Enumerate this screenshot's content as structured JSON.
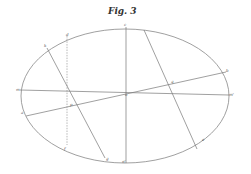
{
  "figure": {
    "title": "Fig. 3",
    "ellipse": {
      "cx": 125,
      "cy": 96,
      "rx": 104,
      "ry": 67
    },
    "labels": {
      "c": "c",
      "d": "d",
      "k": "k",
      "h": "h",
      "b": "b",
      "q": "q",
      "m": "m",
      "o": "o",
      "m_prime": "m'",
      "a": "a",
      "p": "p",
      "f": "f",
      "g": "g",
      "n_prime": "n'",
      "e": "e"
    }
  }
}
